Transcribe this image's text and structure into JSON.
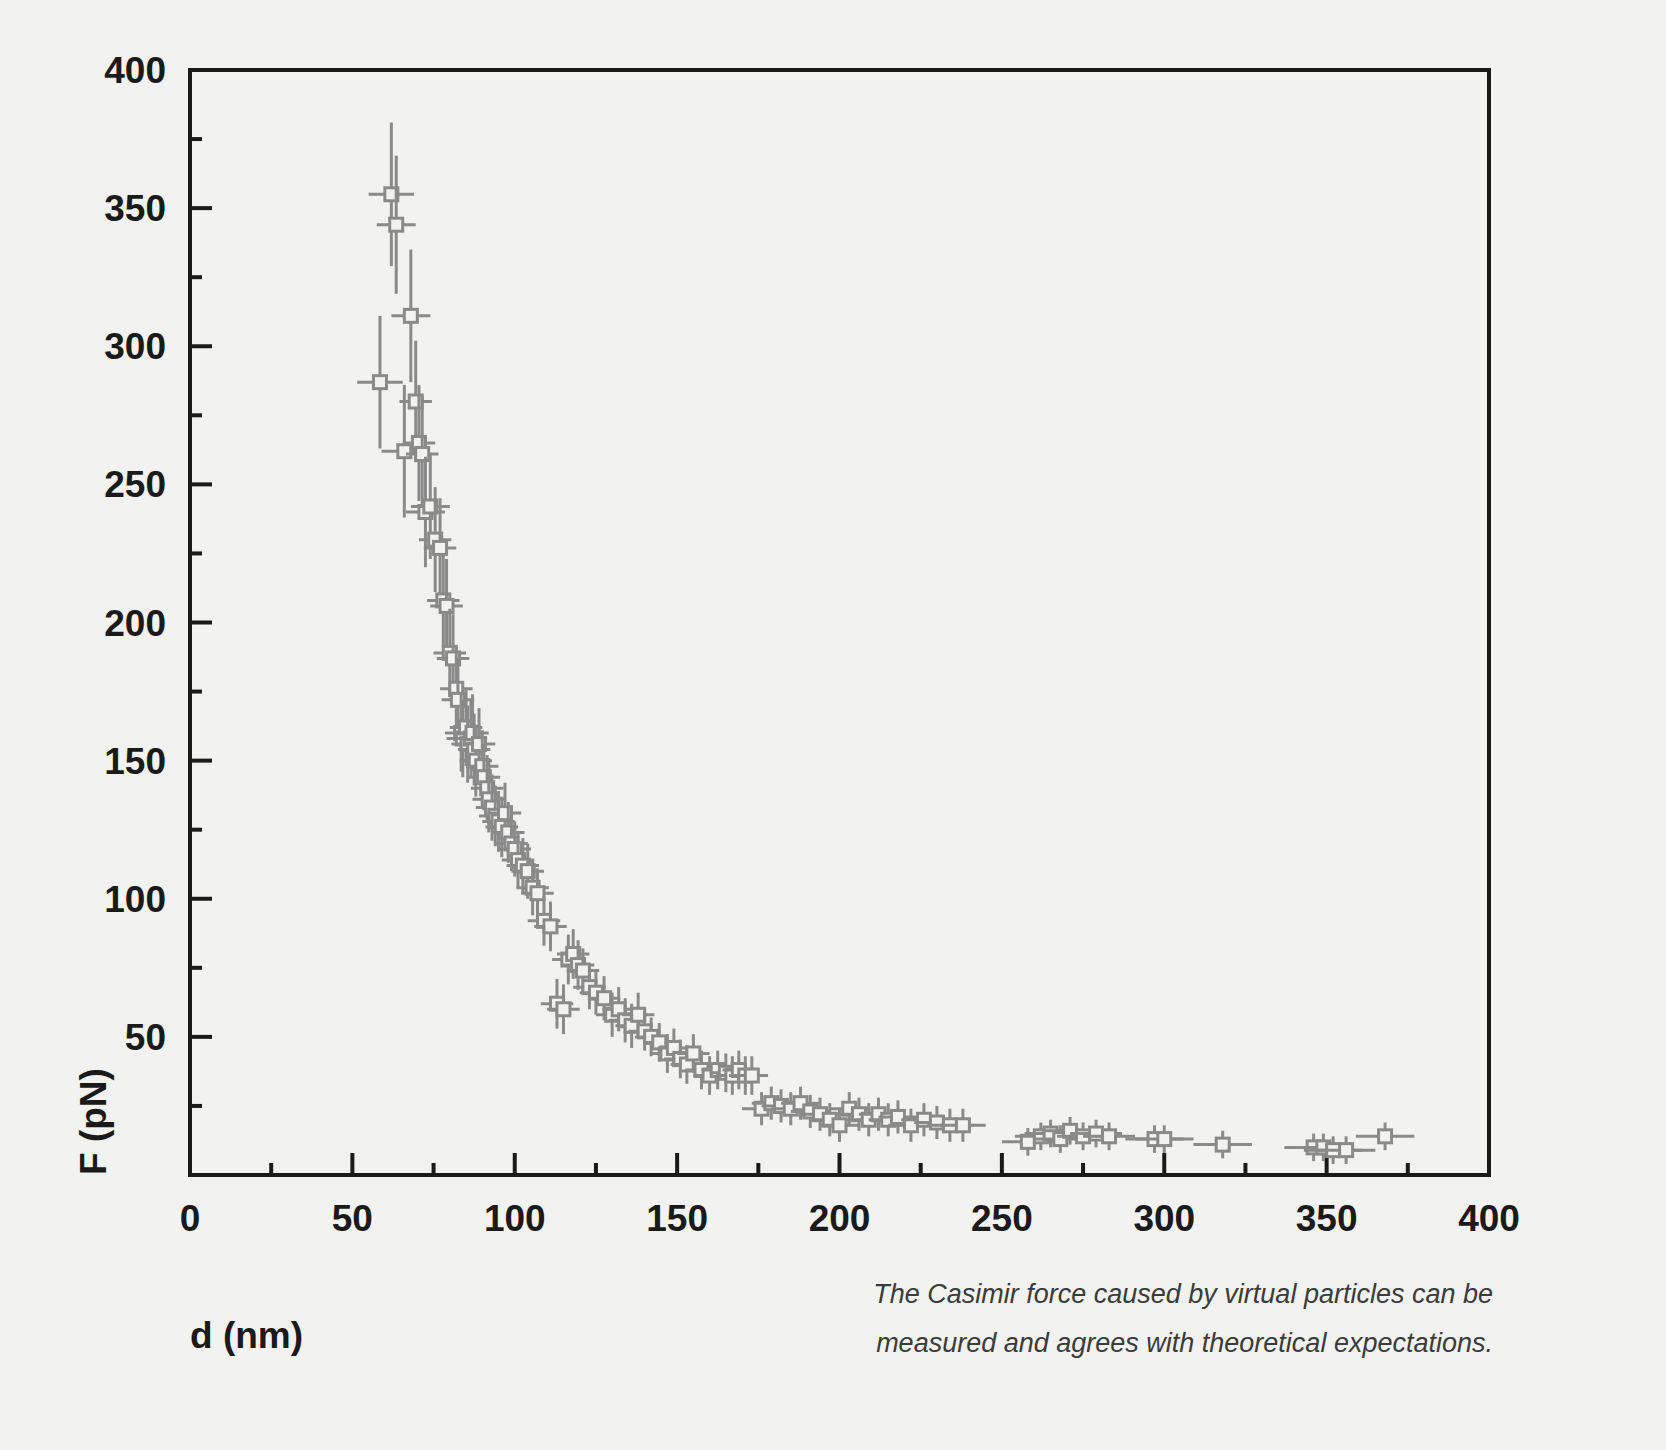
{
  "figure": {
    "background_color": "#f2f2f0",
    "frame_color": "#1a1a1a",
    "data_color": "#8a8a8a"
  },
  "caption": {
    "line1": "The Casimir force caused by virtual particles can be",
    "line2": "measured and agrees with theoretical expectations."
  },
  "chart_data": {
    "type": "scatter",
    "title": "",
    "xlabel": "d (nm)",
    "ylabel": "F (pN)",
    "xlim": [
      0,
      400
    ],
    "ylim": [
      0,
      400
    ],
    "xticks": [
      0,
      50,
      100,
      150,
      200,
      250,
      300,
      350,
      400
    ],
    "yticks": [
      0,
      50,
      100,
      150,
      200,
      250,
      300,
      350,
      400
    ],
    "xtick_labels": [
      "0",
      "50",
      "100",
      "150",
      "200",
      "250",
      "300",
      "350",
      "400"
    ],
    "ytick_labels": [
      "0",
      "50",
      "100",
      "150",
      "200",
      "250",
      "300",
      "350",
      "400"
    ],
    "minor_tick_step": 25,
    "grid": false,
    "legend": null,
    "marker": "open-square",
    "errorbars": "xy",
    "series": [
      {
        "name": "Casimir force measurement",
        "x": [
          58.5,
          62.0,
          63.5,
          66.0,
          68.0,
          69.5,
          70.5,
          71.5,
          72.5,
          74.0,
          75.5,
          77.0,
          78.0,
          79.0,
          80.0,
          81.0,
          82.0,
          82.5,
          83.5,
          84.0,
          85.0,
          85.5,
          86.5,
          87.0,
          87.5,
          88.0,
          89.0,
          90.0,
          90.5,
          91.5,
          92.0,
          93.0,
          94.0,
          95.0,
          96.0,
          97.0,
          98.0,
          99.0,
          100.0,
          101.0,
          102.5,
          104.0,
          105.5,
          107.0,
          109.0,
          111.0,
          113.0,
          115.0,
          116.5,
          118.0,
          119.5,
          121.0,
          123.0,
          125.0,
          127.5,
          130.0,
          132.0,
          134.0,
          136.0,
          138.0,
          140.0,
          142.0,
          144.5,
          147.0,
          149.0,
          151.0,
          153.0,
          155.0,
          157.5,
          160.0,
          162.5,
          165.0,
          167.0,
          169.0,
          171.0,
          173.0,
          176.0,
          179.0,
          182.0,
          185.0,
          188.0,
          191.0,
          194.0,
          197.0,
          200.0,
          203.0,
          206.0,
          209.0,
          212.0,
          215.0,
          218.0,
          222.0,
          226.0,
          230.0,
          234.0,
          238.0,
          258.0,
          262.0,
          265.0,
          268.0,
          271.0,
          275.0,
          279.0,
          283.0,
          297.0,
          300.0,
          318.0,
          346.0,
          349.0,
          352.0,
          356.0,
          368.0
        ],
        "y": [
          287.0,
          355.0,
          344.0,
          262.0,
          311.0,
          280.0,
          265.0,
          261.0,
          240.0,
          242.0,
          230.0,
          227.0,
          208.0,
          206.0,
          189.0,
          187.0,
          176.0,
          172.0,
          160.0,
          158.0,
          162.0,
          156.0,
          158.0,
          160.0,
          154.0,
          150.0,
          156.0,
          148.0,
          144.0,
          140.0,
          136.0,
          133.0,
          130.0,
          128.0,
          126.0,
          131.0,
          124.0,
          120.0,
          118.0,
          114.0,
          112.0,
          110.0,
          104.0,
          102.0,
          92.0,
          90.0,
          62.0,
          60.0,
          78.0,
          80.0,
          76.0,
          74.0,
          68.0,
          66.0,
          64.0,
          58.0,
          60.0,
          56.0,
          54.0,
          58.0,
          52.0,
          50.0,
          48.0,
          44.0,
          46.0,
          42.0,
          40.0,
          44.0,
          38.0,
          36.0,
          38.0,
          37.0,
          36.0,
          38.0,
          36.0,
          36.0,
          24.0,
          26.0,
          25.0,
          24.0,
          26.0,
          23.0,
          22.0,
          20.0,
          18.0,
          24.0,
          22.0,
          20.0,
          22.0,
          20.0,
          21.0,
          18.0,
          20.0,
          19.0,
          18.0,
          18.0,
          12.0,
          14.0,
          15.0,
          13.0,
          16.0,
          14.0,
          15.0,
          14.0,
          13.0,
          13.0,
          11.0,
          10.0,
          10.0,
          9.0,
          9.0,
          14.0
        ],
        "xerr": [
          7.0,
          7.0,
          6.0,
          7.0,
          6.0,
          5.0,
          5.0,
          5.0,
          6.0,
          6.0,
          5.0,
          5.0,
          5.0,
          5.0,
          5.0,
          5.0,
          5.0,
          5.0,
          5.0,
          5.0,
          5.0,
          5.0,
          5.0,
          5.0,
          5.0,
          5.0,
          5.0,
          5.0,
          5.0,
          5.0,
          5.0,
          5.0,
          5.0,
          5.0,
          5.0,
          5.0,
          5.0,
          5.0,
          5.0,
          5.0,
          5.0,
          5.0,
          5.0,
          5.0,
          5.0,
          5.0,
          5.0,
          5.0,
          5.0,
          5.0,
          5.0,
          5.0,
          5.0,
          5.0,
          5.0,
          5.0,
          5.0,
          5.0,
          5.0,
          5.0,
          5.0,
          5.0,
          5.0,
          5.0,
          5.0,
          5.0,
          5.0,
          5.0,
          5.0,
          5.0,
          5.0,
          5.0,
          5.0,
          5.0,
          5.0,
          5.0,
          6.0,
          6.0,
          6.0,
          6.0,
          6.0,
          6.0,
          6.0,
          6.0,
          6.0,
          6.0,
          6.0,
          6.0,
          6.0,
          6.0,
          6.0,
          7.0,
          7.0,
          7.0,
          7.0,
          7.0,
          8.0,
          8.0,
          8.0,
          8.0,
          8.0,
          8.0,
          8.0,
          8.0,
          9.0,
          9.0,
          9.0,
          9.0,
          9.0,
          9.0,
          9.0,
          9.0
        ],
        "yerr": [
          24.0,
          26.0,
          25.0,
          24.0,
          24.0,
          22.0,
          21.0,
          21.0,
          20.0,
          19.0,
          19.0,
          18.0,
          17.0,
          17.0,
          16.0,
          16.0,
          15.0,
          15.0,
          14.0,
          14.0,
          14.0,
          14.0,
          14.0,
          14.0,
          13.0,
          13.0,
          13.0,
          13.0,
          12.0,
          12.0,
          12.0,
          12.0,
          11.0,
          11.0,
          11.0,
          11.0,
          11.0,
          10.0,
          10.0,
          10.0,
          10.0,
          10.0,
          10.0,
          9.0,
          9.0,
          9.0,
          9.0,
          9.0,
          9.0,
          9.0,
          9.0,
          8.0,
          8.0,
          8.0,
          8.0,
          8.0,
          8.0,
          8.0,
          8.0,
          8.0,
          7.0,
          7.0,
          7.0,
          7.0,
          7.0,
          7.0,
          7.0,
          7.0,
          7.0,
          7.0,
          7.0,
          7.0,
          7.0,
          7.0,
          7.0,
          7.0,
          6.0,
          6.0,
          6.0,
          6.0,
          6.0,
          6.0,
          6.0,
          6.0,
          6.0,
          6.0,
          6.0,
          6.0,
          6.0,
          6.0,
          6.0,
          6.0,
          6.0,
          6.0,
          6.0,
          6.0,
          5.0,
          5.0,
          5.0,
          5.0,
          5.0,
          5.0,
          5.0,
          5.0,
          5.0,
          5.0,
          5.0,
          5.0,
          5.0,
          5.0,
          5.0,
          5.0
        ]
      }
    ]
  }
}
